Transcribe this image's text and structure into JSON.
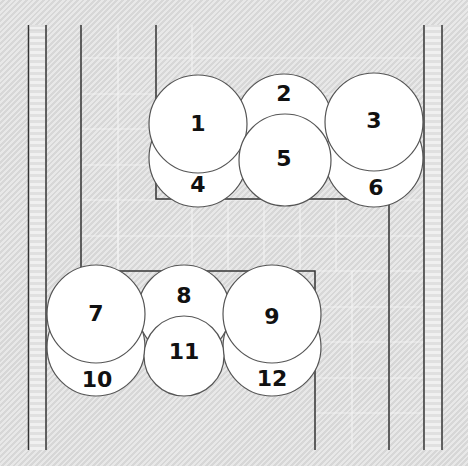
{
  "diagram": {
    "type": "numbered-circle-layout",
    "colors": {
      "background": "#dcdcdc",
      "circle_fill": "#ffffff",
      "line": "#333333",
      "grid": "#f2f2f2"
    },
    "upper_group": {
      "circles": [
        {
          "id": "4",
          "cx": 198,
          "cy": 158,
          "r": 49
        },
        {
          "id": "6",
          "cx": 374,
          "cy": 158,
          "r": 49
        },
        {
          "id": "2",
          "cx": 284,
          "cy": 122,
          "r": 48
        },
        {
          "id": "1",
          "cx": 198,
          "cy": 124,
          "r": 49
        },
        {
          "id": "3",
          "cx": 374,
          "cy": 122,
          "r": 49
        },
        {
          "id": "5",
          "cx": 285,
          "cy": 160,
          "r": 46
        }
      ],
      "labels": [
        {
          "text": "1",
          "x": 198,
          "y": 125
        },
        {
          "text": "2",
          "x": 284,
          "y": 95
        },
        {
          "text": "3",
          "x": 374,
          "y": 122
        },
        {
          "text": "4",
          "x": 198,
          "y": 186
        },
        {
          "text": "5",
          "x": 284,
          "y": 160
        },
        {
          "text": "6",
          "x": 376,
          "y": 189
        }
      ]
    },
    "lower_group": {
      "circles": [
        {
          "id": "10",
          "cx": 96,
          "cy": 347,
          "r": 49
        },
        {
          "id": "12",
          "cx": 272,
          "cy": 347,
          "r": 49
        },
        {
          "id": "8",
          "cx": 184,
          "cy": 311,
          "r": 46
        },
        {
          "id": "7",
          "cx": 96,
          "cy": 314,
          "r": 49
        },
        {
          "id": "9",
          "cx": 272,
          "cy": 314,
          "r": 49
        },
        {
          "id": "11",
          "cx": 184,
          "cy": 356,
          "r": 40
        }
      ],
      "labels": [
        {
          "text": "7",
          "x": 96,
          "y": 315
        },
        {
          "text": "8",
          "x": 184,
          "y": 297
        },
        {
          "text": "9",
          "x": 272,
          "y": 318
        },
        {
          "text": "10",
          "x": 97,
          "y": 381
        },
        {
          "text": "11",
          "x": 184,
          "y": 353
        },
        {
          "text": "12",
          "x": 272,
          "y": 380
        }
      ]
    }
  }
}
